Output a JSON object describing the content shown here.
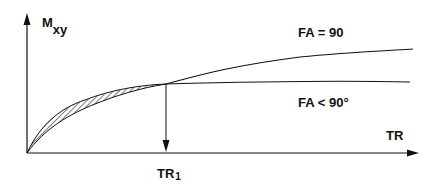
{
  "diagram": {
    "y_axis_label": {
      "main": "M",
      "sub": "xy"
    },
    "x_axis_label": "TR",
    "marker_label": {
      "main": "TR",
      "sub": "1"
    },
    "curve_labels": {
      "upper": "FA = 90",
      "lower": "FA < 90°"
    },
    "line_color": "#111111"
  }
}
